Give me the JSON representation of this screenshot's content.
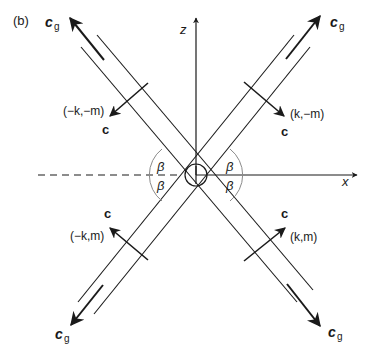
{
  "figure": {
    "panel_label": "(b)",
    "axes": {
      "x_label": "x",
      "z_label": "z"
    },
    "angle_label": "β",
    "group_velocity_label": "c",
    "group_velocity_subscript": "g",
    "phase_velocity_label": "c",
    "wavevectors": {
      "upper_left": "(−k,−m)",
      "upper_right": "(k,−m)",
      "lower_left": "(−k,m)",
      "lower_right": "(k,m)"
    },
    "colors": {
      "line": "#1a1a1a",
      "arc": "#8a8a8a",
      "background": "#ffffff"
    }
  }
}
